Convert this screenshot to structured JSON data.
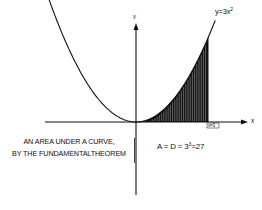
{
  "chart_data": {
    "type": "area",
    "title": "",
    "function": "y=3x^2",
    "curve_label": "y=3x²",
    "xlabel": "x",
    "ylabel": "y",
    "x": [
      -3,
      -2.5,
      -2,
      -1.5,
      -1,
      -0.5,
      0,
      0.5,
      1,
      1.5,
      2,
      2.5,
      3
    ],
    "series": [
      {
        "name": "y=3x²",
        "values": [
          27,
          18.75,
          12,
          6.75,
          3,
          0.75,
          0,
          0.75,
          3,
          6.75,
          12,
          18.75,
          27
        ]
      }
    ],
    "shaded_region": {
      "x_from": 0,
      "x_to": 3,
      "area": 27
    },
    "annotations": [
      {
        "text": "x=3",
        "position": "x-axis at x=3"
      },
      {
        "text": "A = D = 3³=27",
        "position": "below x-axis right of y-axis"
      },
      {
        "text": "AN AREA UNDER A CURVE,",
        "position": "left, below x-axis"
      },
      {
        "text": "BY THE FUNDAMENTALTHEOREM",
        "position": "left, below x-axis"
      }
    ],
    "grid": false,
    "legend": "none"
  },
  "labels": {
    "y_axis": "y",
    "x_axis": "x",
    "curve": "y=3x",
    "curve_exp": "2",
    "boundary": "x=3",
    "area_prefix": "A = D = 3",
    "area_exp": "3",
    "area_suffix": "=27",
    "caption_line1": "AN AREA UNDER A CURVE,",
    "caption_line2": "BY THE FUNDAMENTALTHEOREM"
  },
  "colors": {
    "ink": "#111111",
    "background": "#ffffff"
  }
}
